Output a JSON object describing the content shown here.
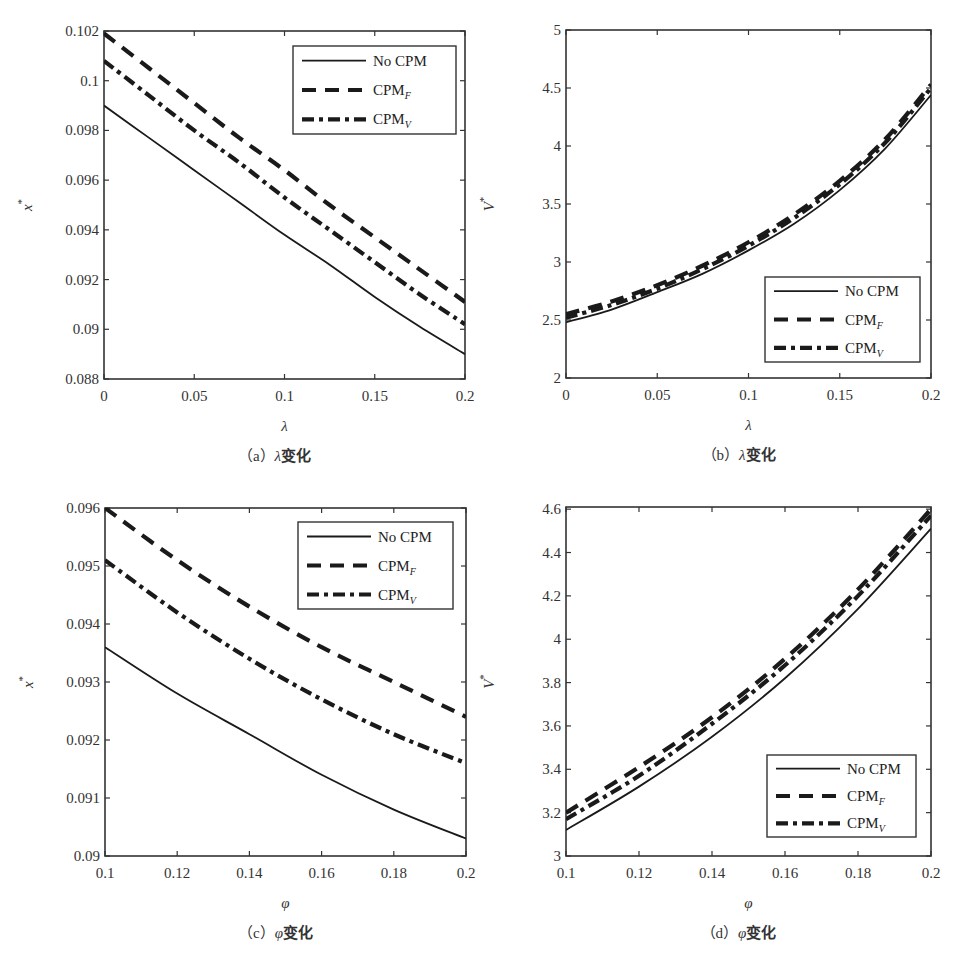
{
  "figure": {
    "panels": [
      "a",
      "b",
      "c",
      "d"
    ]
  },
  "legend_entries": [
    {
      "name": "No CPM",
      "base": "No CPM",
      "sub": "",
      "style": "solid"
    },
    {
      "name": "CPM_F",
      "base": "CPM",
      "sub": "F",
      "style": "dashed"
    },
    {
      "name": "CPM_V",
      "base": "CPM",
      "sub": "V",
      "style": "dashdot"
    }
  ],
  "colors": {
    "line": "#1a1a1a",
    "axis": "#333333",
    "background": "#ffffff"
  },
  "chart_data": [
    {
      "id": "a",
      "type": "line",
      "caption": "（a）λ变化",
      "caption_letter": "a",
      "caption_var": "λ",
      "caption_suffix": "变化",
      "xlabel": "λ",
      "ylabel": "x*",
      "ylabel_base": "x",
      "xlim": [
        0,
        0.2
      ],
      "ylim": [
        0.088,
        0.102
      ],
      "xticks": [
        0,
        0.05,
        0.1,
        0.15,
        0.2
      ],
      "xtick_labels": [
        "0",
        "0.05",
        "0.1",
        "0.15",
        "0.2"
      ],
      "yticks": [
        0.088,
        0.09,
        0.092,
        0.094,
        0.096,
        0.098,
        0.1,
        0.102
      ],
      "ytick_labels": [
        "0.088",
        "0.09",
        "0.092",
        "0.094",
        "0.096",
        "0.098",
        "0.1",
        "0.102"
      ],
      "legend_position": "upper right",
      "grid": false,
      "x": [
        0,
        0.025,
        0.05,
        0.075,
        0.1,
        0.125,
        0.15,
        0.175,
        0.2
      ],
      "series": [
        {
          "name": "No CPM",
          "values": [
            0.099,
            0.0977,
            0.0964,
            0.0951,
            0.0938,
            0.0926,
            0.0913,
            0.0901,
            0.089
          ]
        },
        {
          "name": "CPM_F",
          "values": [
            0.1019,
            0.1005,
            0.0991,
            0.0977,
            0.0964,
            0.095,
            0.0937,
            0.0924,
            0.0911
          ]
        },
        {
          "name": "CPM_V",
          "values": [
            0.1008,
            0.0994,
            0.098,
            0.0967,
            0.0953,
            0.094,
            0.0927,
            0.0914,
            0.0902
          ]
        }
      ]
    },
    {
      "id": "b",
      "type": "line",
      "caption": "（b）λ变化",
      "caption_letter": "b",
      "caption_var": "λ",
      "caption_suffix": "变化",
      "xlabel": "λ",
      "ylabel": "V*",
      "ylabel_base": "V",
      "xlim": [
        0,
        0.2
      ],
      "ylim": [
        2,
        5
      ],
      "xticks": [
        0,
        0.05,
        0.1,
        0.15,
        0.2
      ],
      "xtick_labels": [
        "0",
        "0.05",
        "0.1",
        "0.15",
        "0.2"
      ],
      "yticks": [
        2,
        2.5,
        3,
        3.5,
        4,
        4.5,
        5
      ],
      "ytick_labels": [
        "2",
        "2.5",
        "3",
        "3.5",
        "4",
        "4.5",
        "5"
      ],
      "legend_position": "lower right",
      "grid": false,
      "x": [
        0,
        0.025,
        0.05,
        0.075,
        0.1,
        0.125,
        0.15,
        0.175,
        0.2
      ],
      "series": [
        {
          "name": "No CPM",
          "values": [
            2.48,
            2.59,
            2.74,
            2.9,
            3.1,
            3.33,
            3.62,
            3.98,
            4.44
          ]
        },
        {
          "name": "CPM_F",
          "values": [
            2.55,
            2.66,
            2.8,
            2.97,
            3.17,
            3.41,
            3.7,
            4.06,
            4.53
          ]
        },
        {
          "name": "CPM_V",
          "values": [
            2.52,
            2.63,
            2.77,
            2.94,
            3.14,
            3.38,
            3.67,
            4.03,
            4.5
          ]
        }
      ]
    },
    {
      "id": "c",
      "type": "line",
      "caption": "（c）φ变化",
      "caption_letter": "c",
      "caption_var": "φ",
      "caption_suffix": "变化",
      "xlabel": "φ",
      "ylabel": "x*",
      "ylabel_base": "x",
      "xlim": [
        0.1,
        0.2
      ],
      "ylim": [
        0.09,
        0.096
      ],
      "xticks": [
        0.1,
        0.12,
        0.14,
        0.16,
        0.18,
        0.2
      ],
      "xtick_labels": [
        "0.1",
        "0.12",
        "0.14",
        "0.16",
        "0.18",
        "0.2"
      ],
      "yticks": [
        0.09,
        0.091,
        0.092,
        0.093,
        0.094,
        0.095,
        0.096
      ],
      "ytick_labels": [
        "0.09",
        "0.091",
        "0.092",
        "0.093",
        "0.094",
        "0.095",
        "0.096"
      ],
      "legend_position": "upper right",
      "grid": false,
      "x": [
        0.1,
        0.12,
        0.14,
        0.16,
        0.18,
        0.2
      ],
      "series": [
        {
          "name": "No CPM",
          "values": [
            0.0936,
            0.0928,
            0.0921,
            0.0914,
            0.0908,
            0.0903
          ]
        },
        {
          "name": "CPM_F",
          "values": [
            0.096,
            0.0951,
            0.0943,
            0.0936,
            0.093,
            0.0924
          ]
        },
        {
          "name": "CPM_V",
          "values": [
            0.0951,
            0.0942,
            0.0934,
            0.0927,
            0.0921,
            0.0916
          ]
        }
      ]
    },
    {
      "id": "d",
      "type": "line",
      "caption": "（d）φ变化",
      "caption_letter": "d",
      "caption_var": "φ",
      "caption_suffix": "变化",
      "xlabel": "φ",
      "ylabel": "V*",
      "ylabel_base": "V",
      "xlim": [
        0.1,
        0.2
      ],
      "ylim": [
        3,
        4.61
      ],
      "xticks": [
        0.1,
        0.12,
        0.14,
        0.16,
        0.18,
        0.2
      ],
      "xtick_labels": [
        "0.1",
        "0.12",
        "0.14",
        "0.16",
        "0.18",
        "0.2"
      ],
      "yticks": [
        3,
        3.2,
        3.4,
        3.6,
        3.8,
        4,
        4.2,
        4.4,
        4.6
      ],
      "ytick_labels": [
        "3",
        "3.2",
        "3.4",
        "3.6",
        "3.8",
        "4",
        "4.2",
        "4.4",
        "4.6"
      ],
      "legend_position": "lower right",
      "grid": false,
      "x": [
        0.1,
        0.12,
        0.14,
        0.16,
        0.18,
        0.2
      ],
      "series": [
        {
          "name": "No CPM",
          "values": [
            3.12,
            3.32,
            3.55,
            3.82,
            4.14,
            4.51
          ]
        },
        {
          "name": "CPM_F",
          "values": [
            3.2,
            3.41,
            3.64,
            3.91,
            4.23,
            4.6
          ]
        },
        {
          "name": "CPM_V",
          "values": [
            3.17,
            3.37,
            3.61,
            3.88,
            4.2,
            4.57
          ]
        }
      ]
    }
  ]
}
